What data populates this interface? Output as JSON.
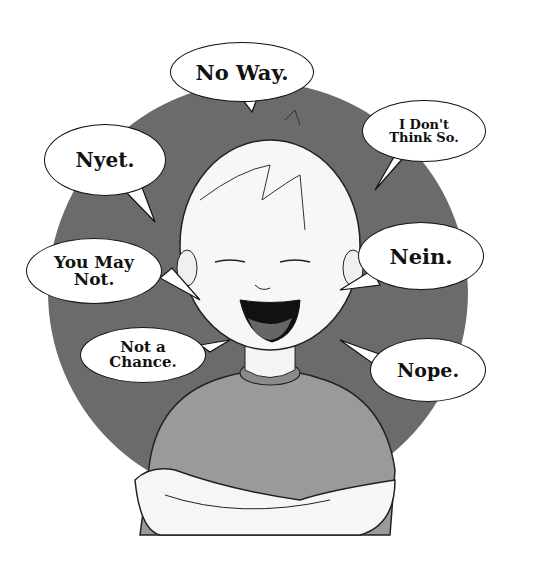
{
  "illustration": {
    "subject": "laughing boy with crossed arms",
    "background_circle_color": "#6b6b6b",
    "bubbles": [
      {
        "id": "no-way",
        "text": "No Way."
      },
      {
        "id": "nyet",
        "text": "Nyet."
      },
      {
        "id": "i-dont-think-so",
        "line1": "I Don't",
        "line2": "Think So."
      },
      {
        "id": "you-may-not",
        "line1": "You May",
        "line2": "Not."
      },
      {
        "id": "nein",
        "text": "Nein."
      },
      {
        "id": "not-a-chance",
        "line1": "Not a",
        "line2": "Chance."
      },
      {
        "id": "nope",
        "text": "Nope."
      }
    ]
  }
}
